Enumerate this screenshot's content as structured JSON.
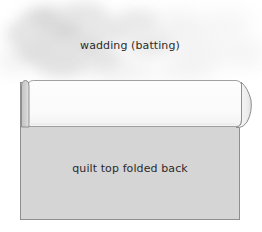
{
  "diagram": {
    "title_text_top": "wadding (batting)",
    "title_text_bottom": "quilt top folded back",
    "labels": [
      {
        "name": "wadding-label",
        "text": "wadding (batting)",
        "x": 130,
        "y": 49
      },
      {
        "name": "quilt-top-label",
        "text": "quilt top folded back",
        "x": 130,
        "y": 172
      }
    ],
    "colors": {
      "background": "#ffffff",
      "quilt_top_fill": "#d5d5d5",
      "folded_band_fill": "#fbfbfb",
      "fold_sliver_fill": "#cfcfcf",
      "outline": "#8a8a8a",
      "outline_light": "#b4b4b4",
      "wadding_cloud": "#c9c9c9",
      "text": "#2b2b2b"
    },
    "geometry": {
      "quilt_top_rect": {
        "x": 20,
        "y": 82,
        "width": 220,
        "height": 138
      },
      "folded_band": {
        "x": 28,
        "y": 80,
        "width": 212,
        "height": 47
      },
      "fold_sliver": {
        "x": 21,
        "y": 80,
        "width": 7,
        "height": 47
      },
      "right_roll": {
        "x": 240,
        "y": 80,
        "bulge_x": 252,
        "bottom_y": 128
      },
      "wadding_area": {
        "x": 0,
        "y": 0,
        "width": 262,
        "height": 82
      }
    }
  }
}
